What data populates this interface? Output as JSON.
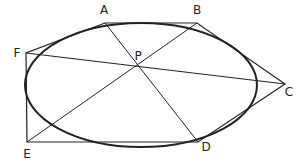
{
  "diagram": {
    "type": "geometry",
    "ellipse": {
      "cx": 141,
      "cy": 85,
      "rx": 116,
      "ry": 62
    },
    "points": {
      "A": {
        "x": 105,
        "y": 23,
        "label": "A",
        "lx": 104,
        "ly": 14
      },
      "B": {
        "x": 197,
        "y": 23,
        "label": "B",
        "lx": 197,
        "ly": 14
      },
      "C": {
        "x": 285,
        "y": 84,
        "label": "C",
        "lx": 289,
        "ly": 96
      },
      "D": {
        "x": 198,
        "y": 142,
        "label": "D",
        "lx": 206,
        "ly": 151
      },
      "E": {
        "x": 27,
        "y": 142,
        "label": "E",
        "lx": 27,
        "ly": 158
      },
      "F": {
        "x": 26,
        "y": 53,
        "label": "F",
        "lx": 17,
        "ly": 57
      },
      "P": {
        "x": 136,
        "y": 67,
        "label": "P",
        "lx": 138,
        "ly": 60
      }
    },
    "hexagon_order": [
      "A",
      "B",
      "C",
      "D",
      "E",
      "F"
    ],
    "diagonals": [
      [
        "A",
        "D"
      ],
      [
        "B",
        "E"
      ],
      [
        "C",
        "F"
      ]
    ],
    "labels": [
      "A",
      "B",
      "C",
      "D",
      "E",
      "F",
      "P"
    ]
  }
}
